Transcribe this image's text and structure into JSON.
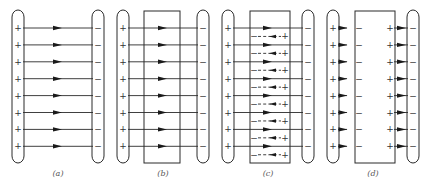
{
  "figure": {
    "rows": 8,
    "row_y_start": 28,
    "row_spacing": 16.9,
    "plate_top": 10,
    "plate_bottom": 163,
    "plate_width": 12,
    "caption_y": 176,
    "colors": {
      "ink": "#2a2a2a",
      "caption": "#555555",
      "background": "#ffffff"
    },
    "symbols": {
      "positive": "+",
      "negative": "−"
    }
  },
  "panels": [
    {
      "id": "a",
      "caption": "(a)",
      "caption_x": 58,
      "left_plate_x": 12,
      "right_plate_x": 92,
      "left_sign": "+",
      "right_sign": "−",
      "slab": null,
      "field": "full",
      "induced": false
    },
    {
      "id": "b",
      "caption": "(b)",
      "caption_x": 163,
      "left_plate_x": 117,
      "right_plate_x": 197,
      "left_sign": "+",
      "right_sign": "−",
      "slab": {
        "x": 144,
        "y": 11,
        "w": 36,
        "h": 152
      },
      "field": "full",
      "induced": false
    },
    {
      "id": "c",
      "caption": "(c)",
      "caption_x": 268,
      "left_plate_x": 222,
      "right_plate_x": 302,
      "left_sign": "+",
      "right_sign": "−",
      "slab": {
        "x": 250,
        "y": 11,
        "w": 40,
        "h": 152
      },
      "field": "full",
      "induced": true,
      "induced_left_sign": "−",
      "induced_right_sign": "+"
    },
    {
      "id": "d",
      "caption": "(d)",
      "caption_x": 373,
      "left_plate_x": 327,
      "right_plate_x": 407,
      "left_sign": "+",
      "right_sign": "−",
      "slab": {
        "x": 355,
        "y": 11,
        "w": 40,
        "h": 152
      },
      "field": "gaps-only",
      "induced": false,
      "slab_left_sign": "−",
      "slab_right_sign": "+"
    }
  ]
}
